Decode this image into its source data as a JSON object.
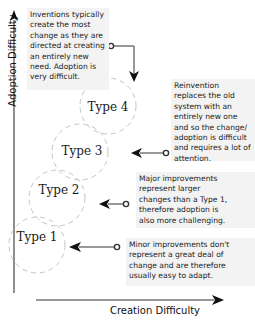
{
  "axes": {
    "y_label": "Adoption Difficulty",
    "x_label": "Creation Difficulty"
  },
  "types": [
    {
      "label": "Type 1"
    },
    {
      "label": "Type 2"
    },
    {
      "label": "Type 3"
    },
    {
      "label": "Type 4"
    }
  ],
  "notes": {
    "inventions": "Inventions typically create the most change as they are directed at creating an entirely new need. Adoption is very difficult.",
    "reinvention": "Reinvention replaces the old system with an entirely new one and so the change/ adoption is difficult and requires a lot of attention.",
    "major": "Major improvements represent larger changes than a Type 1, therefore adoption is also more challenging.",
    "minor": "Minor improvements don't represent a great deal of change and are therefore usually easy to adapt."
  },
  "colors": {
    "circle_stroke": "#bdbdbd",
    "note_background": "#f3f3f3",
    "line": "#222222"
  }
}
